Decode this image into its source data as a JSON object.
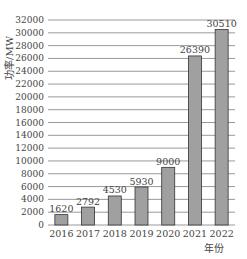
{
  "chart_data": {
    "type": "bar",
    "title": "",
    "xlabel": "年份",
    "ylabel": "功率/MW",
    "categories": [
      "2016",
      "2017",
      "2018",
      "2019",
      "2020",
      "2021",
      "2022"
    ],
    "values": [
      1620,
      2792,
      4530,
      5930,
      9000,
      26390,
      30510
    ],
    "data_labels": [
      "1620",
      "2792",
      "4530",
      "5930",
      "9000",
      "26390",
      "30510"
    ],
    "ylim": [
      0,
      32000
    ],
    "yticks": [
      0,
      2000,
      4000,
      6000,
      8000,
      10000,
      12000,
      14000,
      16000,
      18000,
      20000,
      22000,
      24000,
      26000,
      28000,
      30000,
      32000
    ],
    "grid": true,
    "legend": null,
    "bar_color": "#a0a0a0",
    "bar_edge_color": "#333333",
    "grid_color": "#555555"
  }
}
